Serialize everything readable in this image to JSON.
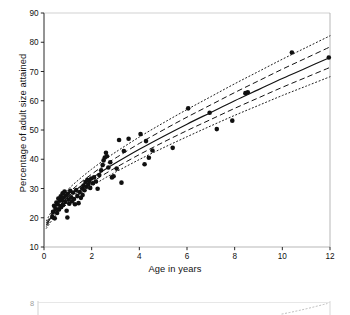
{
  "figure": {
    "background": "#ffffff",
    "ink": "#111111"
  },
  "chart_data": {
    "type": "scatter",
    "title": "",
    "xlabel": "Age in years",
    "ylabel": "Percentage of adult size attained",
    "xlim": [
      0,
      12
    ],
    "ylim": [
      10,
      90
    ],
    "xticks": [
      0,
      2,
      4,
      6,
      8,
      10,
      12
    ],
    "yticks": [
      10,
      20,
      30,
      40,
      50,
      60,
      70,
      80,
      90
    ],
    "grid": false,
    "legend": "none",
    "marker": {
      "shape": "circle",
      "color": "#101010",
      "size": 4.6
    },
    "points": [
      [
        0.35,
        20.3
      ],
      [
        0.38,
        22.0
      ],
      [
        0.42,
        24.1
      ],
      [
        0.45,
        19.8
      ],
      [
        0.48,
        23.0
      ],
      [
        0.52,
        25.2
      ],
      [
        0.55,
        21.6
      ],
      [
        0.58,
        24.6
      ],
      [
        0.6,
        26.6
      ],
      [
        0.63,
        22.8
      ],
      [
        0.66,
        25.8
      ],
      [
        0.7,
        27.3
      ],
      [
        0.72,
        23.7
      ],
      [
        0.75,
        26.1
      ],
      [
        0.78,
        28.4
      ],
      [
        0.8,
        24.4
      ],
      [
        0.83,
        26.9
      ],
      [
        0.86,
        29.0
      ],
      [
        0.9,
        25.4
      ],
      [
        0.92,
        27.6
      ],
      [
        0.95,
        22.4
      ],
      [
        0.98,
        20.1
      ],
      [
        1.0,
        28.2
      ],
      [
        1.03,
        26.2
      ],
      [
        1.06,
        24.8
      ],
      [
        1.1,
        29.2
      ],
      [
        1.14,
        27.0
      ],
      [
        1.18,
        25.6
      ],
      [
        1.22,
        28.6
      ],
      [
        1.26,
        26.4
      ],
      [
        1.3,
        24.6
      ],
      [
        1.35,
        29.5
      ],
      [
        1.4,
        27.4
      ],
      [
        1.45,
        25.0
      ],
      [
        1.5,
        28.8
      ],
      [
        1.55,
        26.8
      ],
      [
        1.6,
        30.0
      ],
      [
        1.62,
        27.8
      ],
      [
        1.66,
        31.0
      ],
      [
        1.7,
        29.4
      ],
      [
        1.74,
        32.2
      ],
      [
        1.78,
        30.6
      ],
      [
        1.82,
        33.0
      ],
      [
        1.86,
        31.4
      ],
      [
        1.9,
        32.6
      ],
      [
        1.94,
        30.2
      ],
      [
        1.98,
        33.4
      ],
      [
        2.05,
        31.8
      ],
      [
        2.1,
        33.8
      ],
      [
        2.18,
        32.4
      ],
      [
        2.25,
        29.9
      ],
      [
        2.32,
        34.6
      ],
      [
        2.4,
        36.2
      ],
      [
        2.46,
        38.0
      ],
      [
        2.5,
        39.6
      ],
      [
        2.55,
        40.6
      ],
      [
        2.6,
        42.2
      ],
      [
        2.64,
        41.0
      ],
      [
        2.7,
        37.2
      ],
      [
        2.78,
        39.0
      ],
      [
        2.85,
        33.8
      ],
      [
        2.92,
        34.2
      ],
      [
        3.05,
        36.8
      ],
      [
        3.15,
        46.6
      ],
      [
        3.25,
        32.0
      ],
      [
        3.35,
        42.8
      ],
      [
        3.55,
        47.0
      ],
      [
        4.05,
        48.6
      ],
      [
        4.22,
        38.3
      ],
      [
        4.28,
        46.2
      ],
      [
        4.4,
        40.5
      ],
      [
        4.55,
        43.0
      ],
      [
        5.4,
        43.9
      ],
      [
        6.05,
        57.4
      ],
      [
        6.95,
        55.9
      ],
      [
        7.25,
        50.3
      ],
      [
        7.9,
        53.2
      ],
      [
        8.45,
        62.6
      ],
      [
        8.55,
        62.9
      ],
      [
        10.4,
        76.5
      ],
      [
        11.95,
        74.8
      ]
    ],
    "curves": [
      {
        "name": "upper-2sd",
        "style": "dotted",
        "label": "+2 SD reference curve",
        "x": [
          0.1,
          0.5,
          1,
          1.5,
          2,
          2.5,
          3,
          4,
          5,
          6,
          7,
          8,
          9,
          10,
          11,
          12
        ],
        "y": [
          19.0,
          24.6,
          29.6,
          33.3,
          36.6,
          39.6,
          42.4,
          47.6,
          52.4,
          57.0,
          61.4,
          65.8,
          70.0,
          74.2,
          78.2,
          82.2
        ]
      },
      {
        "name": "upper-1sd",
        "style": "dashed",
        "label": "+1 SD reference curve",
        "x": [
          0.1,
          0.5,
          1,
          1.5,
          2,
          2.5,
          3,
          4,
          5,
          6,
          7,
          8,
          9,
          10,
          11,
          12
        ],
        "y": [
          18.2,
          23.5,
          28.2,
          31.8,
          34.9,
          37.8,
          40.4,
          45.4,
          50.0,
          54.4,
          58.6,
          62.8,
          66.8,
          70.8,
          74.6,
          78.4
        ]
      },
      {
        "name": "median",
        "style": "solid",
        "label": "Median reference curve",
        "x": [
          0.1,
          0.5,
          1,
          1.5,
          2,
          2.5,
          3,
          4,
          5,
          6,
          7,
          8,
          9,
          10,
          11,
          12
        ],
        "y": [
          17.6,
          22.6,
          27.1,
          30.5,
          33.5,
          36.2,
          38.7,
          43.4,
          47.8,
          52.0,
          56.0,
          60.0,
          63.8,
          67.6,
          71.2,
          74.8
        ]
      },
      {
        "name": "lower-1sd",
        "style": "dashed",
        "label": "-1 SD reference curve",
        "x": [
          0.1,
          0.5,
          1,
          1.5,
          2,
          2.5,
          3,
          4,
          5,
          6,
          7,
          8,
          9,
          10,
          11,
          12
        ],
        "y": [
          17.0,
          21.8,
          26.0,
          29.3,
          32.1,
          34.7,
          37.1,
          41.6,
          45.8,
          49.8,
          53.6,
          57.4,
          61.0,
          64.6,
          68.0,
          71.4
        ]
      },
      {
        "name": "lower-2sd",
        "style": "dotted",
        "label": "-2 SD reference curve",
        "x": [
          0.1,
          0.5,
          1,
          1.5,
          2,
          2.5,
          3,
          4,
          5,
          6,
          7,
          8,
          9,
          10,
          11,
          12
        ],
        "y": [
          16.4,
          20.9,
          24.9,
          28.1,
          30.8,
          33.3,
          35.6,
          39.9,
          43.9,
          47.7,
          51.4,
          55.0,
          58.4,
          61.8,
          65.0,
          68.2
        ]
      }
    ]
  },
  "next_figure": {
    "visible_tick": "8",
    "note": "cropped top edge of the following figure"
  }
}
